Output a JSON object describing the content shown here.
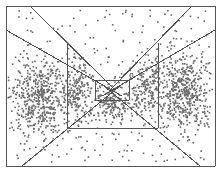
{
  "figure": {
    "title": "",
    "width": 222,
    "height": 172,
    "background_color": "#ffffff"
  },
  "chart_data": {
    "type": "scatter",
    "title": "",
    "subtitle": "",
    "xlabel": "",
    "ylabel": "",
    "xlim": [
      0,
      222
    ],
    "ylim": [
      0,
      172
    ],
    "grid": false,
    "legend": null,
    "tick_labels": {
      "x": [],
      "y": []
    },
    "annotations": [],
    "point_style": {
      "color": "#6b6b6b",
      "marker": "square",
      "size_px": 1.6,
      "count": 1850
    },
    "series": [
      {
        "name": "left-cluster",
        "color": "#6b6b6b",
        "distribution": "gaussian-blob",
        "center": [
          40,
          96
        ],
        "spread": [
          26,
          34
        ],
        "n": 520
      },
      {
        "name": "left-mid-band",
        "color": "#6b6b6b",
        "distribution": "gaussian-blob",
        "center": [
          78,
          92
        ],
        "spread": [
          16,
          30
        ],
        "n": 190
      },
      {
        "name": "right-cluster",
        "color": "#6b6b6b",
        "distribution": "gaussian-blob",
        "center": [
          184,
          92
        ],
        "spread": [
          24,
          34
        ],
        "n": 500
      },
      {
        "name": "right-mid-band",
        "color": "#6b6b6b",
        "distribution": "gaussian-blob",
        "center": [
          146,
          90
        ],
        "spread": [
          16,
          30
        ],
        "n": 190
      },
      {
        "name": "center-core",
        "color": "#6b6b6b",
        "distribution": "gaussian-blob",
        "center": [
          112,
          104
        ],
        "spread": [
          18,
          16
        ],
        "n": 170
      },
      {
        "name": "background-sparse",
        "color": "#6b6b6b",
        "distribution": "uniform",
        "center": [
          111,
          86
        ],
        "spread": [
          100,
          76
        ],
        "n": 280
      }
    ],
    "boundary_lines": {
      "color": "#555555",
      "width_px": 1,
      "segments": [
        {
          "name": "outer-frame-top",
          "x1": 6,
          "y1": 6,
          "x2": 215,
          "y2": 6
        },
        {
          "name": "outer-frame-right",
          "x1": 215,
          "y1": 6,
          "x2": 215,
          "y2": 166
        },
        {
          "name": "outer-frame-bottom",
          "x1": 215,
          "y1": 166,
          "x2": 6,
          "y2": 166
        },
        {
          "name": "outer-frame-left",
          "x1": 6,
          "y1": 166,
          "x2": 6,
          "y2": 6
        },
        {
          "name": "upper-left-outer-diagonal",
          "x1": 30,
          "y1": 6,
          "x2": 115,
          "y2": 90
        },
        {
          "name": "upper-left-inner-diagonal",
          "x1": 6,
          "y1": 30,
          "x2": 122,
          "y2": 96
        },
        {
          "name": "upper-right-outer-diagonal",
          "x1": 192,
          "y1": 6,
          "x2": 110,
          "y2": 90
        },
        {
          "name": "upper-right-inner-diagonal",
          "x1": 215,
          "y1": 30,
          "x2": 102,
          "y2": 96
        },
        {
          "name": "lower-left-diagonal",
          "x1": 22,
          "y1": 166,
          "x2": 120,
          "y2": 86
        },
        {
          "name": "lower-right-diagonal",
          "x1": 200,
          "y1": 166,
          "x2": 104,
          "y2": 86
        },
        {
          "name": "trapezoid-left-vertical",
          "x1": 67,
          "y1": 43,
          "x2": 67,
          "y2": 128
        },
        {
          "name": "trapezoid-right-vertical",
          "x1": 158,
          "y1": 43,
          "x2": 158,
          "y2": 128
        },
        {
          "name": "trapezoid-bottom",
          "x1": 67,
          "y1": 128,
          "x2": 158,
          "y2": 128
        },
        {
          "name": "inner-box-left",
          "x1": 95,
          "y1": 80,
          "x2": 95,
          "y2": 100
        },
        {
          "name": "inner-box-right",
          "x1": 129,
          "y1": 80,
          "x2": 129,
          "y2": 100
        },
        {
          "name": "inner-box-bottom",
          "x1": 95,
          "y1": 100,
          "x2": 129,
          "y2": 100
        },
        {
          "name": "inner-box-top",
          "x1": 95,
          "y1": 80,
          "x2": 129,
          "y2": 80
        }
      ]
    }
  }
}
